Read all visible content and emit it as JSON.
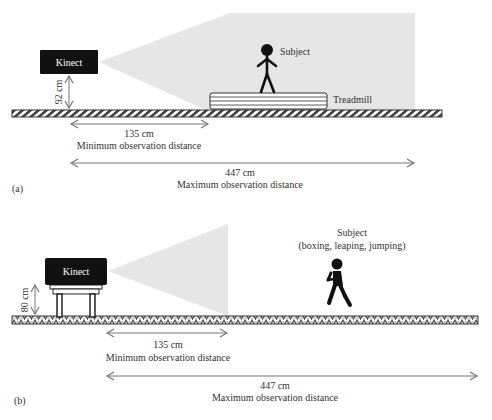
{
  "panel_a": {
    "tag": "(a)",
    "device_label": "Kinect",
    "height_label": "92 cm",
    "subject_label": "Subject",
    "treadmill_label": "Treadmill",
    "min_distance_value": "135 cm",
    "min_distance_caption": "Minimum observation distance",
    "max_distance_value": "447 cm",
    "max_distance_caption": "Maximum observation distance"
  },
  "panel_b": {
    "tag": "(b)",
    "device_label": "Kinect",
    "height_label": "80 cm",
    "subject_label": "Subject",
    "subject_activities": "(boxing, leaping, jumping)",
    "min_distance_value": "135 cm",
    "min_distance_caption": "Minimum observation distance",
    "max_distance_value": "447 cm",
    "max_distance_caption": "Maximum observation distance"
  },
  "colors": {
    "device_fill": "#111111",
    "cone_fill": "#e6e6e6",
    "arrow": "#777777",
    "text": "#333333"
  }
}
